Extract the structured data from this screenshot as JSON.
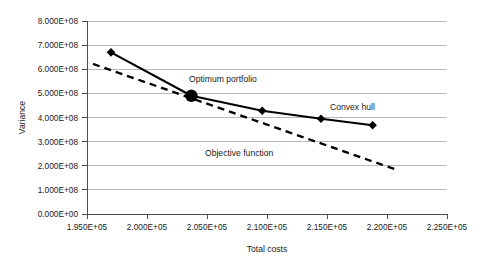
{
  "chart_data": {
    "type": "line",
    "title": "",
    "xlabel": "Total costs",
    "ylabel": "Variance",
    "xlim": [
      195000,
      225000
    ],
    "ylim": [
      0,
      800000000
    ],
    "grid": true,
    "legend_position": "inline-annotations",
    "x_tick_labels": [
      "1.950E+05",
      "2.000E+05",
      "2.050E+05",
      "2.100E+05",
      "2.150E+05",
      "2.200E+05",
      "2.250E+05"
    ],
    "x_tick_values": [
      195000,
      200000,
      205000,
      210000,
      215000,
      220000,
      225000
    ],
    "y_tick_labels": [
      "0.000E+00",
      "1.000E+08",
      "2.000E+08",
      "3.000E+08",
      "4.000E+08",
      "5.000E+08",
      "6.000E+08",
      "7.000E+08",
      "8.000E+08"
    ],
    "y_tick_values": [
      0,
      100000000,
      200000000,
      300000000,
      400000000,
      500000000,
      600000000,
      700000000,
      800000000
    ],
    "series": [
      {
        "name": "Convex hull",
        "style": "solid",
        "marker": "diamond",
        "x": [
          197000,
          203700,
          209600,
          214500,
          218800
        ],
        "values": [
          670000000,
          490000000,
          428000000,
          395000000,
          368000000
        ]
      },
      {
        "name": "Objective function",
        "style": "dashed",
        "marker": "none",
        "x": [
          195500,
          220700
        ],
        "values": [
          622000000,
          185000000
        ]
      }
    ],
    "annotations": [
      {
        "name": "optimum-portfolio",
        "text": "Optimum portfolio",
        "x": 205200,
        "y": 540000000,
        "marker": "large-circle",
        "marker_x": 203700,
        "marker_y": 490000000
      },
      {
        "name": "convex-hull",
        "text": "Convex hull",
        "x": 215800,
        "y": 452000000
      },
      {
        "name": "objective-function",
        "text": "Objective function",
        "x": 207800,
        "y": 272000000
      }
    ],
    "colors": {
      "series_line": "#000000",
      "gridline": "#a6a6a6",
      "axis": "#4d4d4d",
      "text": "#1a1a1a",
      "background": "#ffffff"
    }
  }
}
